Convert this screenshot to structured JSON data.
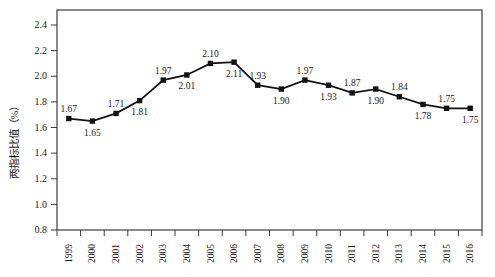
{
  "page": {
    "background": "#ffffff"
  },
  "chart_data": {
    "type": "line",
    "title": "",
    "xlabel": "",
    "ylabel": "两指标比值（%）",
    "categories": [
      "1999",
      "2000",
      "2001",
      "2002",
      "2003",
      "2004",
      "2005",
      "2006",
      "2007",
      "2008",
      "2009",
      "2010",
      "2011",
      "2012",
      "2013",
      "2014",
      "2015",
      "2016"
    ],
    "series": [
      {
        "values": [
          1.67,
          1.65,
          1.71,
          1.81,
          1.97,
          2.01,
          2.1,
          2.11,
          1.93,
          1.9,
          1.97,
          1.93,
          1.87,
          1.9,
          1.84,
          1.78,
          1.75,
          1.75
        ],
        "data_labels": [
          "1.67",
          "1.65",
          "1.71",
          "1.81",
          "1.97",
          "2.01",
          "2.10",
          "2.11",
          "1.93",
          "1.90",
          "1.97",
          "1.93",
          "1.87",
          "1.90",
          "1.84",
          "1.78",
          "1.75",
          "1.75"
        ],
        "label_positions": [
          "above",
          "below",
          "above",
          "below",
          "above",
          "below",
          "above",
          "below",
          "above",
          "below",
          "above",
          "below",
          "above",
          "below",
          "above",
          "below",
          "above",
          "below"
        ],
        "marker": "square",
        "color": "#111111"
      }
    ],
    "ylim": [
      0.8,
      2.4
    ],
    "ytick_step": 0.2,
    "ytick_labels": [
      "0.8",
      "1.0",
      "1.2",
      "1.4",
      "1.6",
      "1.8",
      "2.0",
      "2.2",
      "2.4"
    ],
    "grid": false,
    "legend": "none",
    "plot_box": true,
    "axis_color": "#3c3c3c",
    "text_color": "#1a1a1a"
  }
}
